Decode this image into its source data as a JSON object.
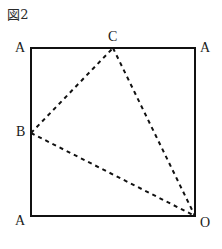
{
  "figure": {
    "caption": "図2",
    "square": {
      "left": 31,
      "top": 48,
      "right": 195,
      "bottom": 216,
      "stroke_color": "#111111",
      "stroke_width": 2
    },
    "dashed_triangle": {
      "stroke_color": "#111111",
      "stroke_width": 2,
      "dash_pattern": "4 4",
      "vertices": [
        "B",
        "C",
        "O"
      ],
      "edges": [
        {
          "name": "edge-b-c",
          "from": "B",
          "to": "C"
        },
        {
          "name": "edge-c-o",
          "from": "C",
          "to": "O"
        },
        {
          "name": "edge-b-o",
          "from": "B",
          "to": "O"
        }
      ]
    },
    "points": [
      {
        "id": "corner-top-left",
        "label": "A",
        "x": 31,
        "y": 48,
        "label_x": 15,
        "label_y": 41
      },
      {
        "id": "corner-top-right",
        "label": "A",
        "x": 195,
        "y": 48,
        "label_x": 200,
        "label_y": 41
      },
      {
        "id": "corner-bottom-left",
        "label": "A",
        "x": 31,
        "y": 216,
        "label_x": 15,
        "label_y": 214
      },
      {
        "id": "corner-bottom-right",
        "label": "O",
        "x": 195,
        "y": 216,
        "label_x": 200,
        "label_y": 216
      },
      {
        "id": "point-c-top-edge",
        "label": "C",
        "x": 113,
        "y": 48,
        "label_x": 108,
        "label_y": 32
      },
      {
        "id": "point-b-left-edge",
        "label": "B",
        "x": 31,
        "y": 133,
        "label_x": 16,
        "label_y": 125
      }
    ]
  }
}
